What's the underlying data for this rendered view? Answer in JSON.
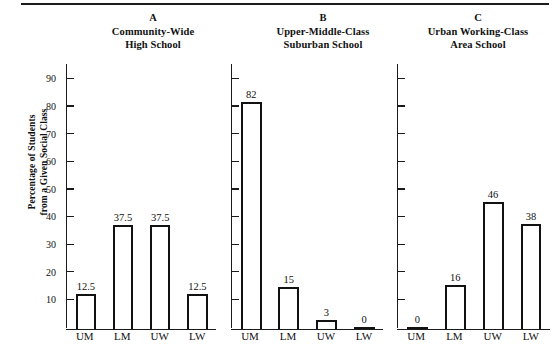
{
  "figure": {
    "y_axis_title_line1": "Percentage of Students",
    "y_axis_title_line2": "from a Given Social Class",
    "y_ticks": [
      10,
      20,
      30,
      40,
      50,
      60,
      70,
      80,
      90
    ],
    "x_categories": [
      "UM",
      "LM",
      "UW",
      "LW"
    ],
    "axis_color": "#121212"
  },
  "panels": [
    {
      "letter": "A",
      "title_line1": "Community-Wide",
      "title_line2": "High School",
      "values": [
        12.5,
        37.5,
        37.5,
        12.5
      ],
      "labels": [
        "12.5",
        "37.5",
        "37.5",
        "12.5"
      ]
    },
    {
      "letter": "B",
      "title_line1": "Upper-Middle-Class",
      "title_line2": "Suburban School",
      "values": [
        82,
        15,
        3,
        0
      ],
      "labels": [
        "82",
        "15",
        "3",
        "0"
      ]
    },
    {
      "letter": "C",
      "title_line1": "Urban Working-Class",
      "title_line2": "Area School",
      "values": [
        0,
        16,
        46,
        38
      ],
      "labels": [
        "0",
        "16",
        "46",
        "38"
      ]
    }
  ],
  "chart_data": {
    "type": "bar",
    "title": "",
    "xlabel": "",
    "ylabel": "Percentage of Students from a Given Social Class",
    "ylim": [
      0,
      95
    ],
    "yticks": [
      10,
      20,
      30,
      40,
      50,
      60,
      70,
      80,
      90
    ],
    "grid": false,
    "legend": "none",
    "categories": [
      "UM",
      "LM",
      "UW",
      "LW"
    ],
    "panels": [
      {
        "id": "A",
        "name": "Community-Wide High School",
        "categories": [
          "UM",
          "LM",
          "UW",
          "LW"
        ],
        "values": [
          12.5,
          37.5,
          37.5,
          12.5
        ]
      },
      {
        "id": "B",
        "name": "Upper-Middle-Class Suburban School",
        "categories": [
          "UM",
          "LM",
          "UW",
          "LW"
        ],
        "values": [
          82,
          15,
          3,
          0
        ]
      },
      {
        "id": "C",
        "name": "Urban Working-Class Area School",
        "categories": [
          "UM",
          "LM",
          "UW",
          "LW"
        ],
        "values": [
          0,
          16,
          46,
          38
        ]
      }
    ]
  }
}
